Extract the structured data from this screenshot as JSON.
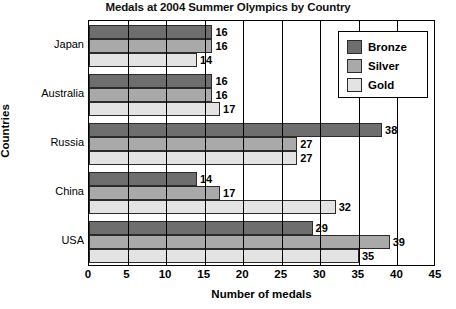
{
  "chart_data": {
    "type": "bar",
    "orientation": "horizontal",
    "title": "Medals at 2004 Summer Olympics by Country",
    "xlabel": "Number of medals",
    "ylabel": "Countries",
    "categories": [
      "Japan",
      "Australia",
      "Russia",
      "China",
      "USA"
    ],
    "series": [
      {
        "name": "Bronze",
        "color": "#6e6e6e",
        "values": [
          16,
          16,
          38,
          14,
          29
        ]
      },
      {
        "name": "Silver",
        "color": "#a9a9a9",
        "values": [
          16,
          16,
          27,
          17,
          39
        ]
      },
      {
        "name": "Gold",
        "color": "#e3e3e3",
        "values": [
          14,
          17,
          27,
          32,
          35
        ]
      }
    ],
    "xlim": [
      0,
      45
    ],
    "xticks": [
      0,
      5,
      10,
      15,
      20,
      25,
      30,
      35,
      40,
      45
    ],
    "xticklabels": [
      "0",
      "5",
      "10",
      "15",
      "20",
      "25",
      "30",
      "35",
      "40",
      "45"
    ],
    "grid": true,
    "grid_axis": "x",
    "legend_position": "top-right",
    "data_labels": true
  }
}
